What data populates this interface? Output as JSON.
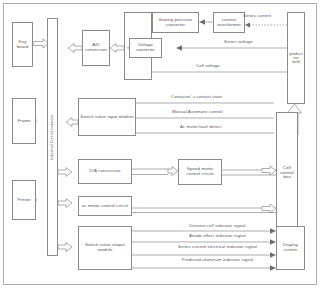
{
  "diagram": {
    "type": "block-diagram",
    "colors": {
      "line": "#8b8b8b",
      "text": "#55545a",
      "background": "#ffffff",
      "arrow_fill": "#ffffff",
      "solid_arrow": "#6d6d6d"
    }
  },
  "blocks": {
    "key_board": "Key board",
    "frame": "Frame",
    "printer": "Printer",
    "industrial_control_computer": "Industrial Control computer",
    "ad_conversion": "A/D conversion",
    "isolation_transducer": "Isolation transducer",
    "flowing_pressure_converter": "flowing pressure converter",
    "current_transformer": "current transformer",
    "voltage_converter": "Voltage converter",
    "production_field": "product ion field",
    "switch_value_input_module": "Switch value input module",
    "da_conversion": "D/A conversion",
    "ac_motor_control_circuit": "ac motor control circuit",
    "speed_motor_control_circuit": "Speed motor control circuit",
    "cell_control_box": "Cell control box",
    "switch_value_output_module": "Switch value output module",
    "display_screen": "Display screen"
  },
  "signals": {
    "series_current": "Series current",
    "series_voltage": "Series voltage",
    "cell_voltage": "Cell voltage",
    "contactor_contact_state": "Contactor’ s contact state",
    "manual_automatic_control": "Manual  Automatic control",
    "ac_motor_fault_detect": "Ac motor fault detect",
    "disease_cell_indicator": "Disease cell indicator signal",
    "anode_effect_indicator": "Anode effect indicator signal",
    "series_current_electrical_indicator": "Series current electrical indicator signal",
    "produced_aluminum_indicator": "Produced aluminum indicator signal"
  }
}
